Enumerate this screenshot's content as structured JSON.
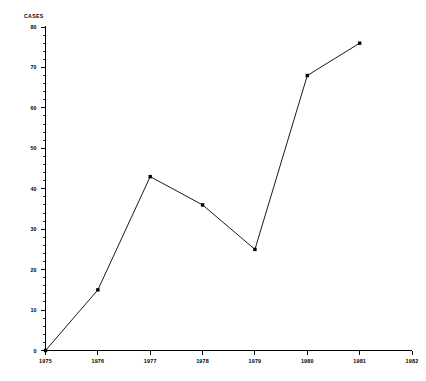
{
  "chart_data": {
    "type": "line",
    "title": "",
    "xlabel": "",
    "ylabel": "CASES",
    "x": [
      1975,
      1976,
      1977,
      1978,
      1979,
      1980,
      1981
    ],
    "values": [
      0,
      15,
      43,
      36,
      25,
      68,
      76
    ],
    "categories": [
      "1975",
      "1976",
      "1977",
      "1978",
      "1979",
      "1980",
      "1981"
    ],
    "xlim": [
      1975,
      1982
    ],
    "ylim": [
      0,
      80
    ],
    "x_tick_labels": [
      "1975",
      "1976",
      "1977",
      "1978",
      "1979",
      "1980",
      "1981",
      "1982"
    ],
    "y_tick_labels": [
      "0",
      "10",
      "20",
      "30",
      "40",
      "50",
      "60",
      "70",
      "80"
    ],
    "y_major_step": 10,
    "y_minor_step": 2,
    "grid": false,
    "legend": "none",
    "marker": "square",
    "line_color": "#1a1a1a",
    "marker_color": "#000000",
    "axis_color": "#000000",
    "background_color": "#ffffff"
  }
}
